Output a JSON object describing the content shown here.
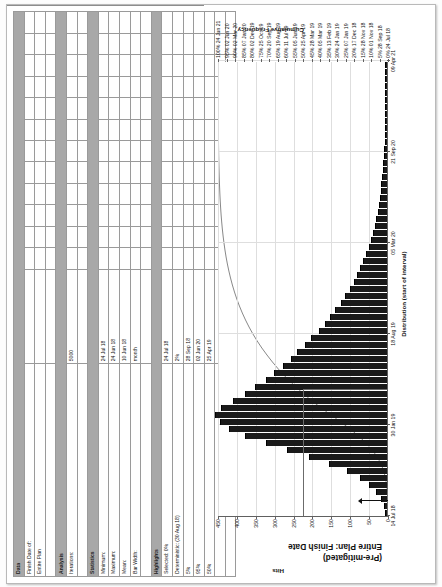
{
  "chart_data": {
    "type": "bar",
    "title": "(Pre-mitigated)  Entire Plan: Finish Date",
    "title_line1": "(Pre-mitigated)",
    "title_line2": "Entire Plan: Finish Date",
    "xlabel": "Distribution (start of interval)",
    "ylabel": "Hits",
    "y2label": "Cumulative Frequency",
    "ylim": [
      0,
      450
    ],
    "yticks": [
      0,
      50,
      100,
      150,
      200,
      250,
      300,
      350,
      400,
      450
    ],
    "xticks": [
      "14 Jul 18",
      "30 Jan 19",
      "18 Aug 19",
      "05 Mar 20",
      "21 Sep 20",
      "09 Apr 21"
    ],
    "grid": true,
    "legend": "none",
    "cumulative_axis": [
      {
        "pct": "100%",
        "date": "24 Jun 21"
      },
      {
        "pct": "95%",
        "date": "02 Jun 20"
      },
      {
        "pct": "90%",
        "date": "02 Mar 20"
      },
      {
        "pct": "85%",
        "date": "07 Jan 20"
      },
      {
        "pct": "80%",
        "date": "02 Dec 19"
      },
      {
        "pct": "75%",
        "date": "25 Oct 19"
      },
      {
        "pct": "70%",
        "date": "20 Sep 19"
      },
      {
        "pct": "65%",
        "date": "19 Aug 19"
      },
      {
        "pct": "60%",
        "date": "11 Jul 19"
      },
      {
        "pct": "55%",
        "date": "05 Jun 19"
      },
      {
        "pct": "50%",
        "date": "25 Apr 19"
      },
      {
        "pct": "45%",
        "date": "28 Mar 19"
      },
      {
        "pct": "40%",
        "date": "05 Mar 19"
      },
      {
        "pct": "35%",
        "date": "13 Feb 19"
      },
      {
        "pct": "30%",
        "date": "24 Jan 19"
      },
      {
        "pct": "25%",
        "date": "07 Jan 19"
      },
      {
        "pct": "20%",
        "date": "17 Dec 18"
      },
      {
        "pct": "15%",
        "date": "28 Nov 18"
      },
      {
        "pct": "10%",
        "date": "01 Nov 18"
      },
      {
        "pct": "5%",
        "date": "28 Sep 18"
      },
      {
        "pct": "0%",
        "date": "24 Jul 18"
      }
    ],
    "bar_values": [
      2,
      6,
      14,
      26,
      44,
      70,
      104,
      152,
      205,
      262,
      318,
      372,
      416,
      440,
      452,
      436,
      404,
      372,
      346,
      318,
      296,
      272,
      252,
      236,
      214,
      198,
      178,
      162,
      148,
      134,
      120,
      108,
      96,
      86,
      76,
      68,
      60,
      52,
      46,
      40,
      35,
      30,
      26,
      22,
      19,
      16,
      14,
      12,
      10,
      8,
      7,
      6,
      5,
      4,
      4,
      3,
      3,
      2,
      2,
      2,
      1,
      1,
      1,
      1,
      1
    ],
    "deterministic_marker": {
      "label": "Deterministic: (30 Aug 18)",
      "date": "30 Aug 18"
    }
  },
  "table": {
    "sections": [
      {
        "header": "Data",
        "rows": [
          {
            "label": "Finish Date of:",
            "value": ""
          },
          {
            "label": "Entire Plan",
            "value": ""
          },
          {
            "label": "",
            "value": ""
          }
        ]
      },
      {
        "header": "Analysis",
        "rows": [
          {
            "label": "Iterations:",
            "value": "5000"
          },
          {
            "label": "",
            "value": ""
          }
        ]
      },
      {
        "header": "Statistics",
        "rows": [
          {
            "label": "Minimum:",
            "value": "24 Jul 18"
          },
          {
            "label": "Maximum:",
            "value": "24 Jun 18"
          },
          {
            "label": "Mean:",
            "value": "10 Jun 18"
          },
          {
            "label": "Bar Width:",
            "value": "month"
          },
          {
            "label": "",
            "value": ""
          }
        ]
      },
      {
        "header": "Highlights",
        "rows": [
          {
            "label": "Selected: 0%",
            "value": "24 Jul 18"
          },
          {
            "label": "Deterministic: (30 Aug 18)",
            "value": "2%"
          },
          {
            "label": "5%",
            "value": "28 Sep 18"
          },
          {
            "label": "95%",
            "value": "02 Jun 20"
          },
          {
            "label": "50%",
            "value": "25 Apr 19"
          },
          {
            "label": "",
            "value": ""
          },
          {
            "label": "",
            "value": ""
          }
        ]
      }
    ]
  },
  "colors": {
    "bar": "#1a1a1a",
    "section_header_bg": "#a8a8a8",
    "grid": "#dedede",
    "axis": "#606060",
    "curve": "#7a7a7a"
  }
}
